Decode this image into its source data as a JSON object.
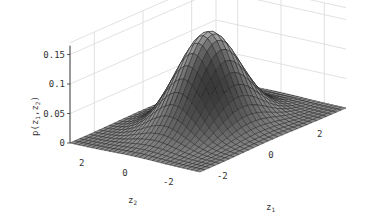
{
  "chart_data": {
    "type": "surface",
    "title": "",
    "function": "bivariate standard normal density p(z1,z2) = 1/(2*pi) * exp(-(z1^2+z2^2)/2)",
    "xlabel": "z_1",
    "ylabel": "z_2",
    "zlabel": "p(z_1,z_2)",
    "xlim": [
      -3,
      3
    ],
    "ylim": [
      -3,
      3
    ],
    "zlim": [
      0,
      0.16
    ],
    "x_ticks": [
      -2,
      0,
      2
    ],
    "x_tick_labels": [
      "-2",
      "0",
      "2"
    ],
    "y_ticks": [
      -2,
      0,
      2
    ],
    "y_tick_labels": [
      "-2",
      "0",
      "2"
    ],
    "z_ticks": [
      0,
      0.05,
      0.1,
      0.15
    ],
    "z_tick_labels": [
      "0",
      "0.05",
      "0.1",
      "0.15"
    ],
    "grid": true,
    "peak": {
      "z1": 0,
      "z2": 0,
      "p": 0.159
    },
    "mesh_resolution": 31,
    "colormap": "gray",
    "colors": {
      "mesh_edge": "#1a1a1a",
      "grid": "#d9d9d9",
      "axis": "#333333"
    }
  },
  "labels": {
    "z_axis_label": "p(z",
    "x_axis_label": "z",
    "x_axis_sub": "1",
    "y_axis_label": "z",
    "y_axis_sub": "2"
  }
}
